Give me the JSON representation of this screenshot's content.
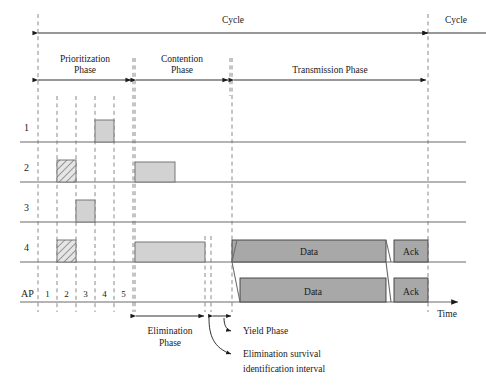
{
  "figure": {
    "type": "timing-diagram",
    "title_absent": true,
    "axis_label": "Time"
  },
  "top_spans": {
    "cycle_main": "Cycle",
    "cycle_next": "Cycle"
  },
  "phases": [
    {
      "id": "prioritization",
      "label_line1": "Prioritization",
      "label_line2": "Phase",
      "x_start": 38,
      "x_end": 133
    },
    {
      "id": "contention",
      "label_line1": "Contention",
      "label_line2": "Phase",
      "x_start": 135,
      "x_end": 230
    },
    {
      "id": "transmission",
      "label_line1": "Transmission Phase",
      "label_line2": "",
      "x_start": 233,
      "x_end": 428
    }
  ],
  "sub_phases": [
    {
      "id": "elimination",
      "label_line1": "Elimination",
      "label_line2": "Phase",
      "x_start": 135,
      "x_end": 205
    },
    {
      "id": "yield",
      "label": "Yield Phase",
      "x_start": 213,
      "x_end": 232
    }
  ],
  "annotations": [
    {
      "id": "yield-phase",
      "text": "Yield Phase"
    },
    {
      "id": "esi-line1",
      "text": "Elimination survival"
    },
    {
      "id": "esi-line2",
      "text": "identification interval"
    }
  ],
  "rows": [
    {
      "id": "node-1",
      "label": "1",
      "baseline": 142
    },
    {
      "id": "node-2",
      "label": "2",
      "baseline": 182
    },
    {
      "id": "node-3",
      "label": "3",
      "baseline": 222
    },
    {
      "id": "node-4",
      "label": "4",
      "baseline": 262
    },
    {
      "id": "ap",
      "label": "AP",
      "baseline": 302
    }
  ],
  "slot_ticks": [
    38,
    57,
    76,
    95,
    114,
    133
  ],
  "slot_labels": [
    "1",
    "2",
    "3",
    "4",
    "5"
  ],
  "guide_lines": [
    38,
    57,
    76,
    95,
    114,
    133,
    135,
    205,
    211,
    232,
    428
  ],
  "bars": [
    {
      "row": "node-1",
      "kind": "light",
      "x": 95,
      "w": 19,
      "h": 22,
      "text": ""
    },
    {
      "row": "node-2",
      "kind": "hatch",
      "x": 57,
      "w": 19,
      "h": 22,
      "text": ""
    },
    {
      "row": "node-2",
      "kind": "light",
      "x": 135,
      "w": 40,
      "h": 20,
      "text": ""
    },
    {
      "row": "node-3",
      "kind": "light",
      "x": 76,
      "w": 19,
      "h": 22,
      "text": ""
    },
    {
      "row": "node-4",
      "kind": "hatch",
      "x": 57,
      "w": 19,
      "h": 22,
      "text": ""
    },
    {
      "row": "node-4",
      "kind": "light",
      "x": 135,
      "w": 70,
      "h": 20,
      "text": ""
    },
    {
      "row": "node-4",
      "kind": "dark",
      "x": 232,
      "w": 154,
      "h": 22,
      "text": "Data"
    },
    {
      "row": "node-4",
      "kind": "dark",
      "x": 394,
      "w": 34,
      "h": 22,
      "text": "Ack"
    },
    {
      "row": "ap",
      "kind": "dark",
      "x": 240,
      "w": 146,
      "h": 24,
      "text": "Data"
    },
    {
      "row": "ap",
      "kind": "dark",
      "x": 394,
      "w": 34,
      "h": 24,
      "text": "Ack"
    }
  ],
  "colors": {
    "bar_light": "#d2d2d2",
    "bar_dark": "#a8a8a8",
    "axis": "#6b6b6b",
    "dash": "#8a8a8a",
    "ink": "#1a1a1a",
    "background": "#ffffff"
  }
}
